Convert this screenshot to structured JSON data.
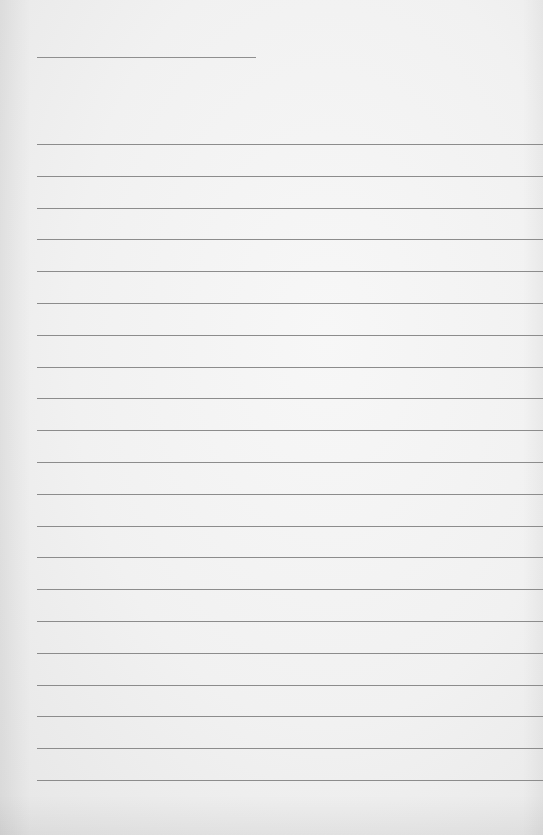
{
  "paper": {
    "type": "lined-notepaper",
    "background_color": "#f1f1f1",
    "line_color": "#8c8c8c",
    "title_line": {
      "present": true
    },
    "ruled_lines": {
      "count": 21,
      "first_y": 144,
      "spacing": 31.8
    },
    "text": []
  }
}
